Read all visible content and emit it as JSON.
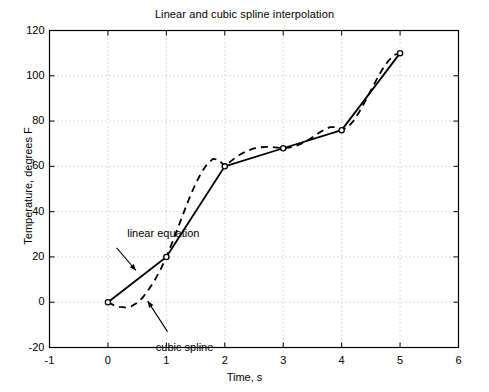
{
  "chart_data": {
    "type": "line",
    "title": "Linear and cubic spline interpolation",
    "xlabel": "Time, s",
    "ylabel": "Temperature, degrees F",
    "xlim": [
      -1,
      6
    ],
    "ylim": [
      -20,
      120
    ],
    "xticks": [
      -1,
      0,
      1,
      2,
      3,
      4,
      5,
      6
    ],
    "yticks": [
      -20,
      0,
      20,
      40,
      60,
      80,
      100,
      120
    ],
    "xtick_labels": [
      "-1",
      "0",
      "1",
      "2",
      "3",
      "4",
      "5",
      "6"
    ],
    "ytick_labels": [
      "-20",
      "0",
      "20",
      "40",
      "60",
      "80",
      "100",
      "120"
    ],
    "grid": true,
    "legend": "none",
    "x": [
      0,
      1,
      2,
      3,
      4,
      5
    ],
    "series": [
      {
        "name": "linear equation",
        "style": "solid",
        "marker": "open-circle",
        "values": [
          0,
          20,
          60,
          68,
          76,
          110
        ]
      },
      {
        "name": "cubic spline",
        "style": "dashed",
        "marker": "none",
        "values": [
          0,
          20,
          60,
          68,
          76,
          110
        ],
        "dense_x": [
          0,
          0.1,
          0.2,
          0.3,
          0.4,
          0.5,
          0.6,
          0.7,
          0.8,
          0.9,
          1,
          1.1,
          1.2,
          1.3,
          1.4,
          1.5,
          1.6,
          1.7,
          1.8,
          1.9,
          2,
          2.1,
          2.2,
          2.3,
          2.4,
          2.5,
          2.6,
          2.7,
          2.8,
          2.9,
          3,
          3.1,
          3.2,
          3.3,
          3.4,
          3.5,
          3.6,
          3.7,
          3.8,
          3.9,
          4,
          4.1,
          4.2,
          4.3,
          4.4,
          4.5,
          4.6,
          4.7,
          4.8,
          4.9,
          5
        ],
        "dense_y": [
          0,
          -1.3,
          -2.1,
          -2.3,
          -1.8,
          -0.3,
          2.2,
          5.7,
          9.6,
          14.4,
          20,
          26.3,
          33.0,
          39.8,
          46.4,
          52.3,
          57.3,
          61.1,
          63.3,
          62.9,
          60,
          62.2,
          64.2,
          65.8,
          67.0,
          67.9,
          68.4,
          68.6,
          68.5,
          68.3,
          68,
          68.3,
          68.9,
          69.9,
          71.2,
          72.8,
          74.6,
          76.2,
          77.3,
          77.3,
          76,
          77.2,
          80.0,
          84.0,
          88.6,
          93.5,
          98.4,
          103.0,
          106.6,
          109.2,
          110
        ]
      }
    ],
    "annotations": [
      {
        "name": "linear equation",
        "text": "linear equation",
        "text_x": 0.33,
        "text_y": 30,
        "arrow_from_x": 0.15,
        "arrow_from_y": 24,
        "arrow_to_x": 0.48,
        "arrow_to_y": 14
      },
      {
        "name": "cubic spline",
        "text": "cubic spline",
        "text_x": 0.82,
        "text_y": -20,
        "arrow_from_x": 1.02,
        "arrow_from_y": -13,
        "arrow_to_x": 0.68,
        "arrow_to_y": 0.5
      }
    ],
    "colors": {
      "line": "#000000",
      "grid": "#b4b4b4",
      "axis": "#000000",
      "background": "#ffffff"
    }
  }
}
